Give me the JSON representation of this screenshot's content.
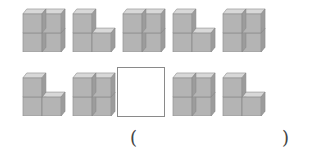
{
  "puzzle": {
    "row1": [
      "square-2x2",
      "L-shape",
      "square-2x2",
      "L-shape",
      "square-2x2"
    ],
    "row2": [
      "L-shape",
      "square-2x2",
      "blank",
      "square-2x2",
      "L-shape"
    ],
    "answer_open": "(",
    "answer_close": ")"
  },
  "colors": {
    "cube_front": "#b4b4b4",
    "cube_top": "#d8d8d8",
    "cube_side": "#9c9c9c",
    "edge": "#8a8a8a"
  }
}
